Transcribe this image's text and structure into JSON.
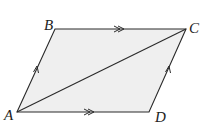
{
  "diagram": {
    "type": "parallelogram",
    "fill_color": "#efefef",
    "stroke_color": "#2a2a2a",
    "vertices": [
      {
        "name": "A",
        "x": 17,
        "y": 112,
        "label_x": 4,
        "label_y": 120
      },
      {
        "name": "B",
        "x": 55,
        "y": 29,
        "label_x": 44,
        "label_y": 30
      },
      {
        "name": "C",
        "x": 186,
        "y": 29,
        "label_x": 189,
        "label_y": 33
      },
      {
        "name": "D",
        "x": 149,
        "y": 112,
        "label_x": 155,
        "label_y": 122
      }
    ],
    "labels": {
      "A": "A",
      "B": "B",
      "C": "C",
      "D": "D"
    },
    "edges": [
      {
        "from": "A",
        "to": "B",
        "marker": "single-arrow"
      },
      {
        "from": "B",
        "to": "C",
        "marker": "double-arrow"
      },
      {
        "from": "D",
        "to": "C",
        "marker": "single-arrow"
      },
      {
        "from": "A",
        "to": "D",
        "marker": "double-arrow"
      }
    ],
    "diagonal": {
      "from": "A",
      "to": "C"
    }
  }
}
